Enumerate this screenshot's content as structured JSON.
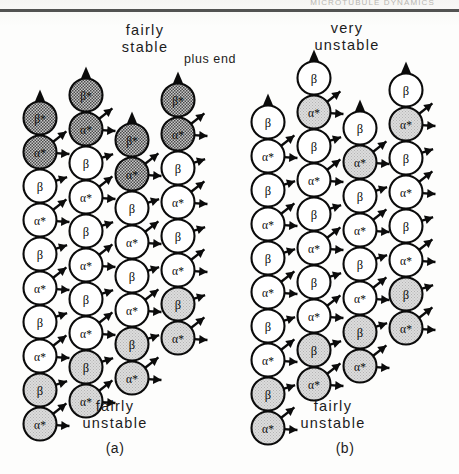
{
  "figure": {
    "running_head": "MICROTUBULE DYNAMICS",
    "plus_end_label": "plus end",
    "subunit_glyphs": {
      "alpha_star": "α*",
      "beta_star": "β*",
      "beta": "β",
      "alpha": "α"
    },
    "colors": {
      "ink": "#0b0b0b",
      "capped_fill": "#8f8f8f",
      "plain_fill": "#ffffff",
      "aged_fill": "#d2d2d2",
      "paper": "#fdfdfc"
    }
  },
  "panels": [
    {
      "id": "a",
      "caption": "(a)",
      "top_label": "fairly\nstable",
      "bottom_label": "fairly\nunstable",
      "columns": [
        {
          "x": 40,
          "top_y": 118,
          "subunits": [
            {
              "label": "β*",
              "state": "capped"
            },
            {
              "label": "α*",
              "state": "capped"
            },
            {
              "label": "β",
              "state": "plain"
            },
            {
              "label": "α*",
              "state": "plain"
            },
            {
              "label": "β",
              "state": "plain"
            },
            {
              "label": "α*",
              "state": "plain"
            },
            {
              "label": "β",
              "state": "plain"
            },
            {
              "label": "α*",
              "state": "plain"
            },
            {
              "label": "β",
              "state": "aged"
            },
            {
              "label": "α*",
              "state": "aged"
            }
          ]
        },
        {
          "x": 86,
          "top_y": 95,
          "subunits": [
            {
              "label": "β*",
              "state": "capped"
            },
            {
              "label": "α*",
              "state": "capped"
            },
            {
              "label": "β",
              "state": "plain"
            },
            {
              "label": "α*",
              "state": "plain"
            },
            {
              "label": "β",
              "state": "plain"
            },
            {
              "label": "α*",
              "state": "plain"
            },
            {
              "label": "β",
              "state": "plain"
            },
            {
              "label": "α*",
              "state": "plain"
            },
            {
              "label": "β",
              "state": "aged"
            },
            {
              "label": "α*",
              "state": "aged"
            }
          ]
        },
        {
          "x": 132,
          "top_y": 140,
          "subunits": [
            {
              "label": "β*",
              "state": "capped"
            },
            {
              "label": "α*",
              "state": "capped"
            },
            {
              "label": "β",
              "state": "plain"
            },
            {
              "label": "α*",
              "state": "plain"
            },
            {
              "label": "β",
              "state": "plain"
            },
            {
              "label": "α*",
              "state": "plain"
            },
            {
              "label": "β",
              "state": "aged"
            },
            {
              "label": "α*",
              "state": "aged"
            }
          ]
        },
        {
          "x": 178,
          "top_y": 100,
          "subunits": [
            {
              "label": "β*",
              "state": "capped"
            },
            {
              "label": "α*",
              "state": "capped"
            },
            {
              "label": "β",
              "state": "plain"
            },
            {
              "label": "α*",
              "state": "plain"
            },
            {
              "label": "β",
              "state": "plain"
            },
            {
              "label": "α*",
              "state": "plain"
            },
            {
              "label": "β",
              "state": "aged"
            },
            {
              "label": "α*",
              "state": "aged"
            }
          ]
        }
      ]
    },
    {
      "id": "b",
      "caption": "(b)",
      "top_label": "very\nunstable",
      "bottom_label": "fairly\nunstable",
      "columns": [
        {
          "x": 268,
          "top_y": 122,
          "subunits": [
            {
              "label": "β",
              "state": "plain"
            },
            {
              "label": "α*",
              "state": "plain"
            },
            {
              "label": "β",
              "state": "plain"
            },
            {
              "label": "α*",
              "state": "plain"
            },
            {
              "label": "β",
              "state": "plain"
            },
            {
              "label": "α*",
              "state": "plain"
            },
            {
              "label": "β",
              "state": "plain"
            },
            {
              "label": "α*",
              "state": "plain"
            },
            {
              "label": "β",
              "state": "aged"
            },
            {
              "label": "α*",
              "state": "aged"
            }
          ]
        },
        {
          "x": 314,
          "top_y": 78,
          "subunits": [
            {
              "label": "β",
              "state": "plain"
            },
            {
              "label": "α*",
              "state": "aged"
            },
            {
              "label": "β",
              "state": "plain"
            },
            {
              "label": "α*",
              "state": "plain"
            },
            {
              "label": "β",
              "state": "plain"
            },
            {
              "label": "α*",
              "state": "plain"
            },
            {
              "label": "β",
              "state": "plain"
            },
            {
              "label": "α*",
              "state": "plain"
            },
            {
              "label": "β",
              "state": "aged"
            },
            {
              "label": "α*",
              "state": "aged"
            }
          ]
        },
        {
          "x": 360,
          "top_y": 128,
          "subunits": [
            {
              "label": "β",
              "state": "plain"
            },
            {
              "label": "α*",
              "state": "aged"
            },
            {
              "label": "β",
              "state": "plain"
            },
            {
              "label": "α*",
              "state": "plain"
            },
            {
              "label": "β",
              "state": "plain"
            },
            {
              "label": "α*",
              "state": "plain"
            },
            {
              "label": "β",
              "state": "aged"
            },
            {
              "label": "α*",
              "state": "aged"
            }
          ]
        },
        {
          "x": 406,
          "top_y": 90,
          "subunits": [
            {
              "label": "β",
              "state": "plain"
            },
            {
              "label": "α*",
              "state": "aged"
            },
            {
              "label": "β",
              "state": "plain"
            },
            {
              "label": "α*",
              "state": "plain"
            },
            {
              "label": "β",
              "state": "plain"
            },
            {
              "label": "α*",
              "state": "plain"
            },
            {
              "label": "β",
              "state": "aged"
            },
            {
              "label": "α*",
              "state": "aged"
            }
          ]
        }
      ]
    }
  ]
}
